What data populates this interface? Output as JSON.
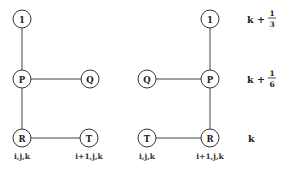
{
  "left_diagram": {
    "nodes": {
      "one": "1",
      "p": "P",
      "q": "Q",
      "r": "R",
      "t": "T"
    },
    "coords": {
      "r": "i,j,k",
      "t": "i+1,j,k"
    }
  },
  "right_diagram": {
    "nodes": {
      "one": "1",
      "p": "P",
      "q": "Q",
      "r": "R",
      "t": "T"
    },
    "coords": {
      "t": "i,j,k",
      "r": "i+1,j,k"
    }
  },
  "levels": {
    "top": {
      "base": "k +",
      "num": "1",
      "den": "3"
    },
    "middle": {
      "base": "k +",
      "num": "1",
      "den": "6"
    },
    "bottom": {
      "base": "k"
    }
  }
}
